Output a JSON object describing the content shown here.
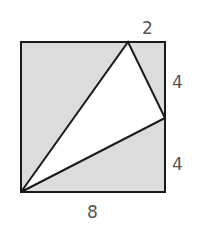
{
  "diagram": {
    "square": {
      "side_total": 8,
      "fill": "#dcdcdc",
      "stroke": "#1a1a1a"
    },
    "triangle": {
      "fill": "#ffffff"
    },
    "labels": {
      "top_segment": "2",
      "right_upper": "4",
      "right_lower": "4",
      "bottom": "8"
    },
    "label_color": "#555555"
  }
}
